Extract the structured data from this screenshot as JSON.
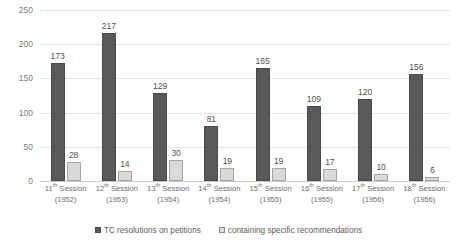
{
  "chart_data": {
    "type": "bar",
    "title": "",
    "xlabel": "",
    "ylabel": "",
    "ylim": [
      0,
      250
    ],
    "yticks": [
      0,
      50,
      100,
      150,
      200,
      250
    ],
    "grid": true,
    "legend_position": "bottom",
    "categories": [
      "11th Session (1952)",
      "12th Session (1953)",
      "13th Session (1954)",
      "14th Session (1954)",
      "15th Session (1955)",
      "16th Session (1955)",
      "17th Session (1956)",
      "18th Session (1956)"
    ],
    "category_parts": [
      {
        "ordinal": "11",
        "suffix": "th",
        "session_word": "Session",
        "year": "(1952)"
      },
      {
        "ordinal": "12",
        "suffix": "th",
        "session_word": "Session",
        "year": "(1953)"
      },
      {
        "ordinal": "13",
        "suffix": "th",
        "session_word": "Session",
        "year": "(1954)"
      },
      {
        "ordinal": "14",
        "suffix": "th",
        "session_word": "Session",
        "year": "(1954)"
      },
      {
        "ordinal": "15",
        "suffix": "th",
        "session_word": "Session",
        "year": "(1955)"
      },
      {
        "ordinal": "16",
        "suffix": "th",
        "session_word": "Session",
        "year": "(1955)"
      },
      {
        "ordinal": "17",
        "suffix": "th",
        "session_word": "Session",
        "year": "(1956)"
      },
      {
        "ordinal": "18",
        "suffix": "th",
        "session_word": "Session",
        "year": "(1956)"
      }
    ],
    "series": [
      {
        "name": "TC resolutions on petitions",
        "color": "#595959",
        "values": [
          173,
          217,
          129,
          81,
          165,
          109,
          120,
          156
        ]
      },
      {
        "name": "containing specific recommendations",
        "color": "#d9d9d9",
        "values": [
          28,
          14,
          30,
          19,
          19,
          17,
          10,
          6
        ]
      }
    ]
  },
  "legend": {
    "entries": [
      {
        "label": "TC resolutions on petitions",
        "swatch": "dark"
      },
      {
        "label": "containing specific recommendations",
        "swatch": "light"
      }
    ]
  },
  "colors": {
    "series_dark": "#595959",
    "series_light": "#d9d9d9",
    "gridline": "#e4e4e4",
    "axis_text": "#7b7b7b",
    "background": "#ffffff"
  }
}
